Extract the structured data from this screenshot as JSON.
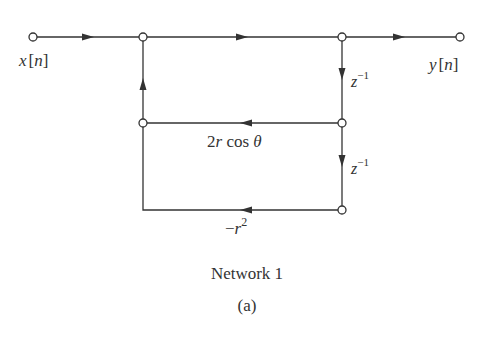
{
  "diagram": {
    "title": "Network 1",
    "subfigure": "(a)",
    "input_label": {
      "var": "x",
      "open": "[",
      "idx": "n",
      "close": "]"
    },
    "output_label": {
      "var": "y",
      "open": "[",
      "idx": "n",
      "close": "]"
    },
    "delay_labels": [
      {
        "base": "z",
        "exp": "−1"
      },
      {
        "base": "z",
        "exp": "−1"
      }
    ],
    "gain_2rcos": {
      "coef": "2",
      "var": "r",
      "func": " cos ",
      "angle": "θ"
    },
    "gain_r2": {
      "sign": "−",
      "var": "r",
      "exp": "2"
    },
    "colors": {
      "line": "#333333",
      "node_fill": "#ffffff"
    }
  }
}
